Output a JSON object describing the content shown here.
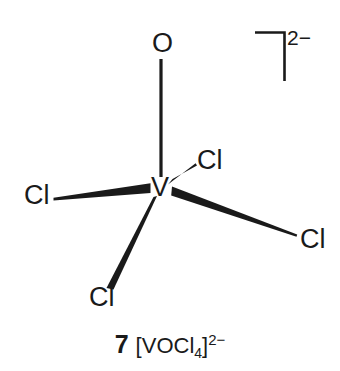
{
  "diagram": {
    "type": "chemical-structure",
    "title_number": "7",
    "formula_base": "[VOCl",
    "formula_sub": "4",
    "formula_close": "]",
    "formula_charge": "2−",
    "overall_charge": "2−",
    "central_atom": {
      "label": "V",
      "x": 160,
      "y": 188
    },
    "ligands": [
      {
        "name": "oxo-ligand",
        "label": "O",
        "x": 160,
        "y": 44,
        "bond": "plain"
      },
      {
        "name": "chloro-ligand-left",
        "label": "Cl",
        "x": 36,
        "y": 196,
        "bond": "wedge"
      },
      {
        "name": "chloro-ligand-upper-right",
        "label": "Cl",
        "x": 208,
        "y": 161,
        "bond": "wedge"
      },
      {
        "name": "chloro-ligand-right",
        "label": "Cl",
        "x": 312,
        "y": 240,
        "bond": "wedge"
      },
      {
        "name": "chloro-ligand-bottom",
        "label": "Cl",
        "x": 101,
        "y": 298,
        "bond": "wedge"
      }
    ],
    "bracket": {
      "name": "charge-bracket",
      "charge": "2−"
    },
    "colors": {
      "ink": "#1a1a1a",
      "background": "#ffffff"
    }
  }
}
